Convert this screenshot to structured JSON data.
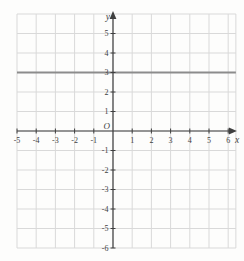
{
  "chart_data": {
    "type": "line",
    "title": "",
    "xlabel": "x",
    "ylabel": "y",
    "origin_label": "O",
    "xlim": [
      -5,
      6.4
    ],
    "ylim": [
      -6,
      6
    ],
    "x_ticks": [
      -5,
      -4,
      -3,
      -2,
      -1,
      1,
      2,
      3,
      4,
      5,
      6
    ],
    "y_ticks": [
      5,
      4,
      3,
      2,
      1,
      -1,
      -2,
      -3,
      -4,
      -5,
      -6
    ],
    "grid": true,
    "legend": false,
    "series": [
      {
        "name": "horizontal-line-y-3",
        "equation_y": 3,
        "x_start": -5,
        "x_end": 6.4,
        "color": "#8c8c8c",
        "stroke_width": 2
      }
    ],
    "colors": {
      "background": "#fdfdfc",
      "grid": "#d9d9d9",
      "axis": "#3f3f3f",
      "tick_labels": "#3f3f3f"
    }
  }
}
